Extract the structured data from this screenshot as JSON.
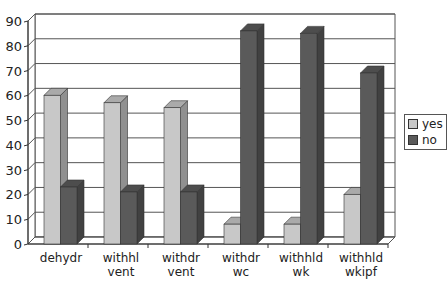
{
  "chart_data": {
    "type": "bar",
    "style": "3d-clustered-column",
    "title": "",
    "xlabel": "",
    "ylabel": "",
    "ylim": [
      0,
      90
    ],
    "yticks": [
      0,
      10,
      20,
      30,
      40,
      50,
      60,
      70,
      80,
      90
    ],
    "grid": true,
    "legend_position": "right",
    "categories": [
      [
        "dehydr"
      ],
      [
        "withhl",
        "vent"
      ],
      [
        "withdr",
        "vent"
      ],
      [
        "withdr",
        "wc"
      ],
      [
        "withhld",
        "wk"
      ],
      [
        "withhld",
        "wkipf"
      ]
    ],
    "series": [
      {
        "name": "yes",
        "color": "#c8c8c8",
        "values": [
          60,
          57,
          55,
          8,
          8,
          20
        ]
      },
      {
        "name": "no",
        "color": "#5a5a5a",
        "values": [
          23,
          21,
          21,
          86,
          85,
          69
        ]
      }
    ]
  },
  "legend": {
    "items": [
      {
        "label": "yes",
        "color": "#c8c8c8"
      },
      {
        "label": "no",
        "color": "#5a5a5a"
      }
    ]
  }
}
